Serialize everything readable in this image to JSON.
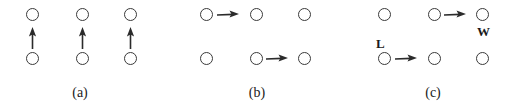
{
  "figure": {
    "width": 514,
    "height": 111,
    "background_color": "#ffffff",
    "stroke_color": "#3a3a3a",
    "text_color": "#1a1a1a",
    "node_glyph": "open-circle",
    "arrow_glyph": "solid-arrow",
    "grid": {
      "rows": 2,
      "cols": 3
    }
  },
  "panels": [
    {
      "id": "a",
      "caption": "(a)",
      "caption_x": 80,
      "caption_y": 86,
      "origin_x": 26,
      "nodes": [
        {
          "name": "node-a-r0c0",
          "x": 26,
          "y": 8,
          "row": 0,
          "col": 0
        },
        {
          "name": "node-a-r0c1",
          "x": 76,
          "y": 8,
          "row": 0,
          "col": 1
        },
        {
          "name": "node-a-r0c2",
          "x": 124,
          "y": 8,
          "row": 0,
          "col": 2
        },
        {
          "name": "node-a-r1c0",
          "x": 26,
          "y": 52,
          "row": 1,
          "col": 0
        },
        {
          "name": "node-a-r1c1",
          "x": 76,
          "y": 52,
          "row": 1,
          "col": 1
        },
        {
          "name": "node-a-r1c2",
          "x": 124,
          "y": 52,
          "row": 1,
          "col": 2
        }
      ],
      "arrows": [
        {
          "name": "arrow-a-col0-up",
          "direction": "up",
          "x": 26,
          "y": 27,
          "from": "node-a-r1c0",
          "to": "node-a-r0c0"
        },
        {
          "name": "arrow-a-col1-up",
          "direction": "up",
          "x": 76,
          "y": 27,
          "from": "node-a-r1c1",
          "to": "node-a-r0c1"
        },
        {
          "name": "arrow-a-col2-up",
          "direction": "up",
          "x": 124,
          "y": 27,
          "from": "node-a-r1c2",
          "to": "node-a-r0c2"
        }
      ],
      "labels": []
    },
    {
      "id": "b",
      "caption": "(b)",
      "caption_x": 257,
      "caption_y": 86,
      "origin_x": 200,
      "nodes": [
        {
          "name": "node-b-r0c0",
          "x": 200,
          "y": 8,
          "row": 0,
          "col": 0
        },
        {
          "name": "node-b-r0c1",
          "x": 250,
          "y": 8,
          "row": 0,
          "col": 1
        },
        {
          "name": "node-b-r0c2",
          "x": 298,
          "y": 8,
          "row": 0,
          "col": 2
        },
        {
          "name": "node-b-r1c0",
          "x": 200,
          "y": 52,
          "row": 1,
          "col": 0
        },
        {
          "name": "node-b-r1c1",
          "x": 250,
          "y": 52,
          "row": 1,
          "col": 1
        },
        {
          "name": "node-b-r1c2",
          "x": 298,
          "y": 52,
          "row": 1,
          "col": 2
        }
      ],
      "arrows": [
        {
          "name": "arrow-b-top-right",
          "direction": "right",
          "x": 217,
          "y": 9,
          "from": "node-b-r0c0",
          "to": "node-b-r0c1"
        },
        {
          "name": "arrow-b-bottom-right",
          "direction": "right",
          "x": 266,
          "y": 53,
          "from": "node-b-r1c1",
          "to": "node-b-r1c2"
        }
      ],
      "labels": []
    },
    {
      "id": "c",
      "caption": "(c)",
      "caption_x": 433,
      "caption_y": 86,
      "origin_x": 378,
      "nodes": [
        {
          "name": "node-c-r0c0",
          "x": 378,
          "y": 8,
          "row": 0,
          "col": 0
        },
        {
          "name": "node-c-r0c1",
          "x": 428,
          "y": 8,
          "row": 0,
          "col": 1
        },
        {
          "name": "node-c-r0c2",
          "x": 476,
          "y": 8,
          "row": 0,
          "col": 2
        },
        {
          "name": "node-c-r1c0",
          "x": 378,
          "y": 52,
          "row": 1,
          "col": 0
        },
        {
          "name": "node-c-r1c1",
          "x": 428,
          "y": 52,
          "row": 1,
          "col": 1
        },
        {
          "name": "node-c-r1c2",
          "x": 476,
          "y": 52,
          "row": 1,
          "col": 2
        }
      ],
      "arrows": [
        {
          "name": "arrow-c-top-right",
          "direction": "right",
          "x": 444,
          "y": 9,
          "from": "node-c-r0c1",
          "to": "node-c-r0c2"
        },
        {
          "name": "arrow-c-bottom-right",
          "direction": "right",
          "x": 395,
          "y": 53,
          "from": "node-c-r1c0",
          "to": "node-c-r1c1"
        }
      ],
      "labels": [
        {
          "name": "label-w",
          "text": "W",
          "x": 477,
          "y": 25,
          "attached_to": "node-c-r0c2",
          "position": "below"
        },
        {
          "name": "label-l",
          "text": "L",
          "x": 376,
          "y": 37,
          "attached_to": "node-c-r1c0",
          "position": "above"
        }
      ]
    }
  ]
}
